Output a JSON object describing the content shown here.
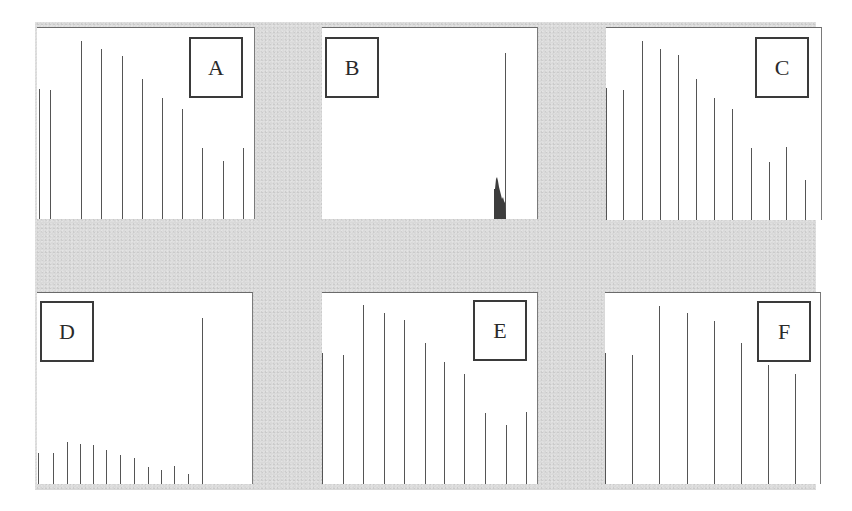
{
  "figure": {
    "background_color": "#d9d9d9",
    "panel_color": "#ffffff",
    "line_color": "#555555"
  },
  "chart_data": [
    {
      "type": "bar",
      "panel_label": "A",
      "title": "",
      "xlabel": "",
      "ylabel": "",
      "categories": [
        "1",
        "2",
        "3",
        "4",
        "5",
        "6",
        "7",
        "8",
        "9",
        "10",
        "11"
      ],
      "values": [
        130,
        129,
        178,
        170,
        163,
        140,
        121,
        110,
        71,
        58,
        71
      ],
      "grid": false,
      "legend_position": "top-right label box"
    },
    {
      "type": "bar",
      "panel_label": "B",
      "title": "",
      "xlabel": "",
      "ylabel": "",
      "categories": [
        "spike-region",
        "peak"
      ],
      "values": [
        41,
        166
      ],
      "note": "Single tall line near right edge with a dark filled cluster of short spikes just to its left",
      "grid": false,
      "legend_position": "top-left label box"
    },
    {
      "type": "bar",
      "panel_label": "C",
      "title": "",
      "xlabel": "",
      "ylabel": "",
      "categories": [
        "1",
        "2",
        "3",
        "4",
        "5",
        "6",
        "7",
        "8",
        "9",
        "10",
        "11",
        "12"
      ],
      "values": [
        132,
        130,
        179,
        171,
        165,
        141,
        122,
        111,
        72,
        58,
        73,
        40
      ],
      "grid": false,
      "legend_position": "top-right label box"
    },
    {
      "type": "bar",
      "panel_label": "D",
      "title": "",
      "xlabel": "",
      "ylabel": "",
      "categories": [
        "1",
        "2",
        "3",
        "4",
        "5",
        "6",
        "7",
        "8",
        "9",
        "10",
        "11",
        "12",
        "13"
      ],
      "values": [
        31,
        31,
        42,
        40,
        39,
        34,
        29,
        26,
        17,
        14,
        18,
        10,
        166
      ],
      "grid": false,
      "legend_position": "top-left label box"
    },
    {
      "type": "bar",
      "panel_label": "E",
      "title": "",
      "xlabel": "",
      "ylabel": "",
      "categories": [
        "1",
        "2",
        "3",
        "4",
        "5",
        "6",
        "7",
        "8",
        "9",
        "10",
        "11"
      ],
      "values": [
        131,
        129,
        179,
        171,
        164,
        141,
        122,
        110,
        71,
        59,
        72
      ],
      "grid": false,
      "legend_position": "top-right label box"
    },
    {
      "type": "bar",
      "panel_label": "F",
      "title": "",
      "xlabel": "",
      "ylabel": "",
      "categories": [
        "1",
        "2",
        "3",
        "4",
        "5",
        "6",
        "7",
        "8"
      ],
      "values": [
        131,
        129,
        178,
        171,
        163,
        141,
        119,
        110
      ],
      "grid": false,
      "legend_position": "top-right label box"
    }
  ],
  "panels": [
    {
      "label": "A",
      "left": 37,
      "top": 27,
      "width": 218,
      "height": 192,
      "box": {
        "left": 152,
        "top": 9
      },
      "bars_x": [
        2,
        13,
        44,
        64,
        85,
        105,
        125,
        145,
        165,
        186,
        206
      ]
    },
    {
      "label": "B",
      "left": 322,
      "top": 27,
      "width": 216,
      "height": 192,
      "box": {
        "left": 3,
        "top": 9
      },
      "bars_x": [
        183
      ]
    },
    {
      "label": "C",
      "left": 606,
      "top": 27,
      "width": 216,
      "height": 193,
      "box": {
        "left": 149,
        "top": 9
      },
      "bars_x": [
        0,
        17,
        36,
        54,
        72,
        90,
        108,
        126,
        145,
        163,
        180,
        199
      ]
    },
    {
      "label": "D",
      "left": 37,
      "top": 292,
      "width": 216,
      "height": 192,
      "box": {
        "left": 3,
        "top": 8
      },
      "bars_x": [
        1,
        16,
        30,
        43,
        56,
        69,
        83,
        97,
        111,
        124,
        137,
        151,
        165
      ]
    },
    {
      "label": "E",
      "left": 322,
      "top": 292,
      "width": 216,
      "height": 192,
      "box": {
        "left": 151,
        "top": 7
      },
      "bars_x": [
        0,
        21,
        41,
        62,
        82,
        103,
        122,
        142,
        163,
        184,
        204
      ]
    },
    {
      "label": "F",
      "left": 605,
      "top": 292,
      "width": 216,
      "height": 192,
      "box": {
        "left": 152,
        "top": 8
      },
      "bars_x": [
        0,
        27,
        54,
        82,
        109,
        136,
        163,
        190
      ]
    }
  ]
}
